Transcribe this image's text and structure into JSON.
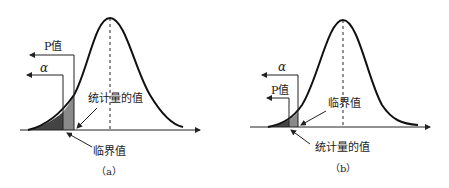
{
  "figure": {
    "panels": [
      {
        "id": "a",
        "caption": "（a）",
        "labels": {
          "p_value": "P值",
          "alpha": "α",
          "statistic_value": "统计量的值",
          "critical_value": "临界值"
        },
        "description": "Statistic value lies in the rejection region: P值 < α"
      },
      {
        "id": "b",
        "caption": "（b）",
        "labels": {
          "alpha": "α",
          "p_value": "P值",
          "critical_value": "临界值",
          "statistic_value": "统计量的值"
        },
        "description": "Statistic value lies beyond critical value: P值 < α (smaller tail)"
      }
    ],
    "colors": {
      "curve": "#111111",
      "dark_shade": "#444444",
      "light_shade": "#8a8a8a",
      "axis": "#222222"
    }
  }
}
